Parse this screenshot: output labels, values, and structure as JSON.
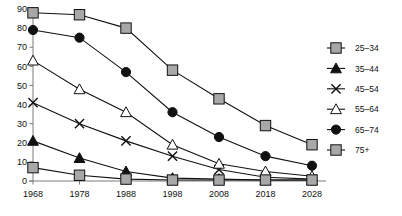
{
  "chart_data": {
    "type": "line",
    "title": "",
    "subtitle": "",
    "xlabel": "",
    "ylabel": "",
    "x": [
      1968,
      1978,
      1988,
      1998,
      2008,
      2018,
      2028
    ],
    "xticklabels": [
      "1968",
      "1978",
      "1988",
      "1998",
      "2008",
      "2018",
      "2028"
    ],
    "yticklabels": [
      "0",
      "10",
      "20",
      "30",
      "40",
      "50",
      "60",
      "70",
      "80",
      "90"
    ],
    "ylim": [
      0,
      90
    ],
    "ytick_step": 10,
    "grid": false,
    "legend_position": "right",
    "series": [
      {
        "name": "25–34",
        "marker": "square-gray",
        "color": "#a8a8a8",
        "values": [
          88,
          87,
          80,
          58,
          43,
          29,
          19
        ]
      },
      {
        "name": "35–44",
        "marker": "triangle-filled",
        "color": "#111111",
        "values": [
          21,
          12,
          5,
          1.5,
          1,
          0.5,
          0.5
        ]
      },
      {
        "name": "45–54",
        "marker": "x-cross",
        "color": "#111111",
        "values": [
          41,
          30,
          21,
          13,
          6,
          2,
          1
        ]
      },
      {
        "name": "55–64",
        "marker": "triangle-open",
        "color": "#ffffff",
        "values": [
          63,
          48,
          36,
          19,
          9,
          5,
          2.5
        ]
      },
      {
        "name": "65–74",
        "marker": "circle-filled",
        "color": "#111111",
        "values": [
          79,
          75,
          57,
          36,
          23,
          13,
          8
        ]
      },
      {
        "name": "75+",
        "marker": "square-gray",
        "color": "#a8a8a8",
        "values": [
          7,
          3,
          1,
          0.5,
          0.5,
          0.5,
          0.5
        ]
      }
    ]
  },
  "legend": {
    "entries": [
      {
        "label": "25–34"
      },
      {
        "label": "35–44"
      },
      {
        "label": "45–54"
      },
      {
        "label": "55–64"
      },
      {
        "label": "65–74"
      },
      {
        "label": "75+"
      }
    ]
  },
  "axes": {
    "y_ticks": [
      "90",
      "80",
      "70",
      "60",
      "50",
      "40",
      "30",
      "20",
      "10",
      "0"
    ],
    "x_ticks": [
      "1968",
      "1978",
      "1988",
      "1998",
      "2008",
      "2018",
      "2028"
    ]
  }
}
